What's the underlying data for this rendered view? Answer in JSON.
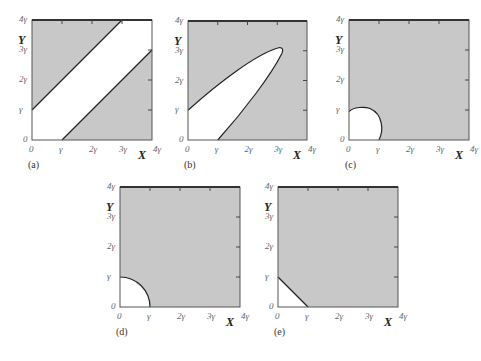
{
  "figure": {
    "fill_color": "#c8c8c8",
    "white_color": "#ffffff",
    "axis_color": "#555555",
    "curve_color": "#222222",
    "tick_labels": [
      "0",
      "γ",
      "2γ",
      "3γ",
      "4γ"
    ],
    "x_axis_title": "X",
    "y_axis_title": "Y",
    "panels": [
      {
        "id": "a",
        "label": "(a)",
        "region_description": "Diagonal band |X - Y| < γ unshaded",
        "box": {
          "left": 32,
          "top": 20,
          "size": 120
        }
      },
      {
        "id": "b",
        "label": "(b)",
        "region_description": "Elongated elliptical region along diagonal unshaded, tip near (3.2γ, 3.1γ)",
        "box": {
          "left": 188,
          "top": 21,
          "size": 119
        }
      },
      {
        "id": "c",
        "label": "(c)",
        "region_description": "Small bulged region near origin unshaded, within ~γ of axes",
        "box": {
          "left": 349,
          "top": 20,
          "size": 120
        }
      },
      {
        "id": "d",
        "label": "(d)",
        "region_description": "Quarter circle of radius γ at origin unshaded",
        "box": {
          "left": 120,
          "top": 187,
          "size": 120
        }
      },
      {
        "id": "e",
        "label": "(e)",
        "region_description": "Triangle X + Y < γ unshaded",
        "box": {
          "left": 278,
          "top": 187,
          "size": 120
        }
      }
    ]
  }
}
